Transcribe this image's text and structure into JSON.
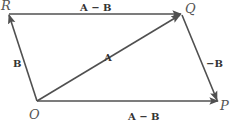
{
  "diagram": {
    "type": "vector-parallelogram",
    "line_color": "#505050",
    "points": {
      "R": {
        "label": "R",
        "x": 8,
        "y": 14
      },
      "Q": {
        "label": "Q",
        "x": 181,
        "y": 14
      },
      "O": {
        "label": "O",
        "x": 37,
        "y": 101
      },
      "P": {
        "label": "P",
        "x": 218,
        "y": 101
      }
    },
    "vectors": [
      {
        "id": "RQ",
        "from": "R",
        "to": "Q",
        "label": "A − B"
      },
      {
        "id": "OR",
        "from": "O",
        "to": "R",
        "label": "B"
      },
      {
        "id": "OQ",
        "from": "O",
        "to": "Q",
        "label": "A"
      },
      {
        "id": "QP",
        "from": "Q",
        "to": "P",
        "label": "−B"
      },
      {
        "id": "OP",
        "from": "O",
        "to": "P",
        "label": "A − B"
      }
    ]
  }
}
